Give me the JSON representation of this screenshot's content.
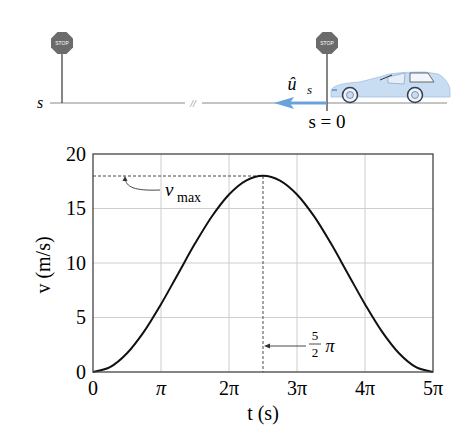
{
  "diagram": {
    "position_label": "s",
    "origin_label": "s = 0",
    "unit_vector_label": "û",
    "unit_vector_subscript": "s",
    "stop_sign_text": "STOP",
    "break_symbol": "//",
    "colors": {
      "arrow": "#6aa3dc",
      "car_body": "#c8dcf2",
      "stop_sign": "#6b6b6b",
      "ground": "#888888"
    }
  },
  "chart_data": {
    "type": "line",
    "title": "",
    "xlabel": "t (s)",
    "ylabel": "v (m/s)",
    "xlim": [
      0,
      15.708
    ],
    "ylim": [
      0,
      20
    ],
    "grid": true,
    "x_ticks": [
      0,
      3.1416,
      6.2832,
      9.4248,
      12.5664,
      15.708
    ],
    "x_tick_labels": [
      "0",
      "π",
      "2π",
      "3π",
      "4π",
      "5π"
    ],
    "y_ticks": [
      0,
      5,
      10,
      15,
      20
    ],
    "y_tick_labels": [
      "0",
      "5",
      "10",
      "15",
      "20"
    ],
    "series": [
      {
        "name": "v(t)",
        "x": [
          0,
          0.785,
          1.571,
          2.356,
          3.142,
          3.927,
          4.712,
          5.498,
          6.283,
          7.069,
          7.854,
          8.639,
          9.425,
          10.21,
          10.996,
          11.781,
          12.566,
          13.352,
          14.137,
          14.923,
          15.708
        ],
        "values": [
          0,
          0.44,
          1.72,
          3.71,
          6.22,
          9.0,
          11.78,
          14.29,
          16.28,
          17.56,
          18.0,
          17.56,
          16.28,
          14.29,
          11.78,
          9.0,
          6.22,
          3.71,
          1.72,
          0.44,
          0
        ]
      }
    ],
    "annotations": [
      {
        "text": "v_max",
        "label_main": "v",
        "label_sub": "max",
        "y": 18,
        "style": "dashed horizontal to peak"
      },
      {
        "text": "5/2 π",
        "numerator": "5",
        "denominator": "2",
        "symbol": "π",
        "x": 7.854,
        "style": "dashed vertical at peak"
      }
    ]
  }
}
